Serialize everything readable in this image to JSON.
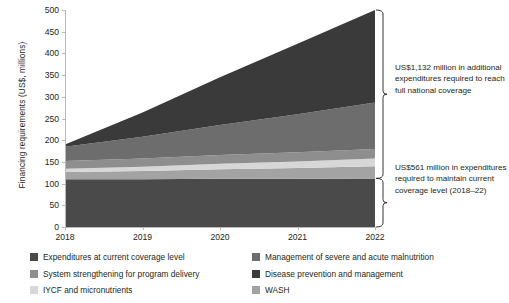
{
  "chart_data": {
    "type": "area",
    "title": "",
    "xlabel": "",
    "ylabel": "Financing requirements (US$, millions)",
    "x": [
      2018,
      2019,
      2020,
      2021,
      2022
    ],
    "xticklabels": [
      "2018",
      "2019",
      "2020",
      "2021",
      "2022"
    ],
    "ylim": [
      0,
      500
    ],
    "yticks": [
      0,
      50,
      100,
      150,
      200,
      250,
      300,
      350,
      400,
      450,
      500
    ],
    "yticklabels": [
      "0",
      "50",
      "100",
      "150",
      "200",
      "250",
      "300",
      "350",
      "400",
      "450",
      "500"
    ],
    "grid": false,
    "stacked": true,
    "legend_position": "bottom",
    "series": [
      {
        "name": "Expenditures at current coverage level",
        "color": "#4a4a4a",
        "values": [
          110,
          110,
          111,
          111,
          112
        ]
      },
      {
        "name": "WASH",
        "color": "#a3a3a3",
        "values": [
          17,
          19,
          22,
          25,
          28
        ]
      },
      {
        "name": "IYCF and micronutrients",
        "color": "#d7d7d7",
        "values": [
          7,
          10,
          13,
          15,
          18
        ]
      },
      {
        "name": "System strengthening for program delivery",
        "color": "#8e8e8e",
        "values": [
          18,
          19,
          20,
          21,
          22
        ]
      },
      {
        "name": "Management of severe and acute malnutrition",
        "color": "#6d6d6d",
        "values": [
          33,
          50,
          69,
          88,
          107
        ]
      },
      {
        "name": "Disease prevention and management",
        "color": "#3a3a3a",
        "values": [
          5,
          56,
          110,
          162,
          213
        ]
      }
    ],
    "totals": [
      190,
      264,
      345,
      422,
      500
    ],
    "annotations": [
      {
        "id": "additional-expenditures",
        "text": "US$1,132 million in additional expenditures required to reach full national coverage",
        "bracket_range": [
          112,
          500
        ]
      },
      {
        "id": "maintain-current-coverage",
        "text": "US$561 million in expenditures required to maintain current coverage level (2018–22)",
        "bracket_range": [
          0,
          112
        ]
      }
    ]
  },
  "legend": {
    "items": [
      {
        "label": "Expenditures at current coverage level",
        "color": "#4a4a4a"
      },
      {
        "label": "Management of severe and acute malnutrition",
        "color": "#6d6d6d"
      },
      {
        "label": "System strengthening for program delivery",
        "color": "#8e8e8e"
      },
      {
        "label": "Disease prevention and management",
        "color": "#3a3a3a"
      },
      {
        "label": "IYCF and micronutrients",
        "color": "#d7d7d7"
      },
      {
        "label": "WASH",
        "color": "#a3a3a3"
      }
    ]
  }
}
